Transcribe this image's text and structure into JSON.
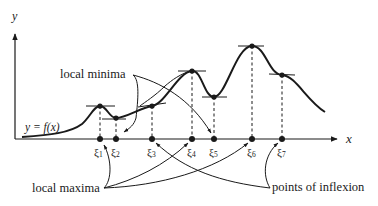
{
  "axes": {
    "x_label": "x",
    "y_label": "y"
  },
  "curve": {
    "label": "y = f(x)"
  },
  "points": [
    {
      "name": "ξ",
      "sub": "1",
      "type": "local maximum"
    },
    {
      "name": "ξ",
      "sub": "2",
      "type": "local minimum"
    },
    {
      "name": "ξ",
      "sub": "3",
      "type": "point of inflexion"
    },
    {
      "name": "ξ",
      "sub": "4",
      "type": "local maximum"
    },
    {
      "name": "ξ",
      "sub": "5",
      "type": "local minimum"
    },
    {
      "name": "ξ",
      "sub": "6",
      "type": "local maximum"
    },
    {
      "name": "ξ",
      "sub": "7",
      "type": "point of inflexion"
    }
  ],
  "annotations": {
    "local_minima": "local minima",
    "local_maxima": "local maxima",
    "points_of_inflexion": "points of inflexion"
  },
  "colors": {
    "ink": "#1a1a1a",
    "background": "#ffffff"
  }
}
